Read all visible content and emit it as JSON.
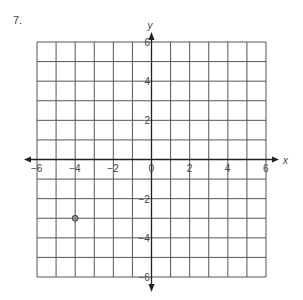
{
  "problem": {
    "number": "7."
  },
  "graph": {
    "x_axis_label": "x",
    "y_axis_label": "y",
    "x_range": [
      -6,
      6
    ],
    "y_range": [
      -6,
      6
    ],
    "grid_step": 1,
    "x_tick_labels": [
      "-6",
      "-4",
      "-2",
      "0",
      "2",
      "4",
      "6"
    ],
    "y_tick_labels": [
      "6",
      "4",
      "2",
      "-2",
      "-4",
      "-6"
    ],
    "grid_color": "#555555",
    "axis_color": "#222222",
    "point_color": "#888888"
  },
  "points": [
    {
      "x": -4,
      "y": -3
    }
  ]
}
